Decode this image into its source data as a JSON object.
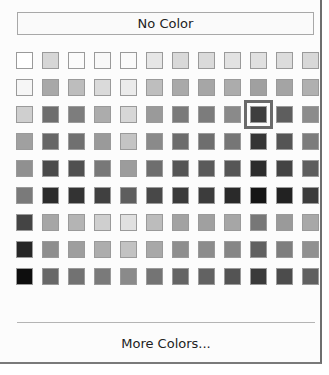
{
  "picker": {
    "no_color_label": "No Color",
    "more_colors_label": "More Colors...",
    "selected": {
      "row": 2,
      "col": 9
    },
    "rows": [
      [
        "#ffffff",
        "#d6d6d6",
        "#fbfbfb",
        "#f8f8f8",
        "#fafafa",
        "#e6e6e6",
        "#d9d9d9",
        "#dadada",
        "#e2e2e2",
        "#e0e0e0",
        "#dcdcdc",
        "#d8d8d8"
      ],
      [
        "#f6f6f6",
        "#a8a8a8",
        "#bdbdbd",
        "#dadada",
        "#ebebeb",
        "#bebebe",
        "#a9a9a9",
        "#a6a6a6",
        "#acacac",
        "#a0a0a0",
        "#a4a4a4",
        "#b0b0b0"
      ],
      [
        "#cfcfcf",
        "#6e6e6e",
        "#7d7d7d",
        "#acacac",
        "#d7d7d7",
        "#9a9a9a",
        "#7a7a7a",
        "#7c7c7c",
        "#8a8a8a",
        "#3e3e3e",
        "#5e5e5e",
        "#8c8c8c"
      ],
      [
        "#a0a0a0",
        "#666666",
        "#707070",
        "#9a9a9a",
        "#c4c4c4",
        "#8a8a8a",
        "#6c6c6c",
        "#6e6e6e",
        "#767676",
        "#353535",
        "#555555",
        "#7c7c7c"
      ],
      [
        "#909090",
        "#4a4a4a",
        "#505050",
        "#787878",
        "#9c9c9c",
        "#6e6e6e",
        "#555555",
        "#5a5a5a",
        "#565656",
        "#2c2c2c",
        "#444444",
        "#5e5e5e"
      ],
      [
        "#7a7a7a",
        "#2c2c2c",
        "#333333",
        "#404040",
        "#5e5e5e",
        "#484848",
        "#3a3a3a",
        "#3c3c3c",
        "#2a2a2a",
        "#151515",
        "#222222",
        "#3c3c3c"
      ],
      [
        "#444444",
        "#a6a6a6",
        "#b4b4b4",
        "#cfcfcf",
        "#e0e0e0",
        "#bcbcbc",
        "#a2a2a2",
        "#a0a0a0",
        "#a6a6a6",
        "#777777",
        "#9a9a9a",
        "#a8a8a8"
      ],
      [
        "#262626",
        "#8e8e8e",
        "#9e9e9e",
        "#adadad",
        "#c2c2c2",
        "#a8a8a8",
        "#8e8e8e",
        "#8c8c8c",
        "#868686",
        "#606060",
        "#7e7e7e",
        "#909090"
      ],
      [
        "#0e0e0e",
        "#686868",
        "#727272",
        "#7a7a7a",
        "#8a8a8a",
        "#747474",
        "#646464",
        "#626262",
        "#545454",
        "#3a3a3a",
        "#4c4c4c",
        "#606060"
      ]
    ]
  }
}
